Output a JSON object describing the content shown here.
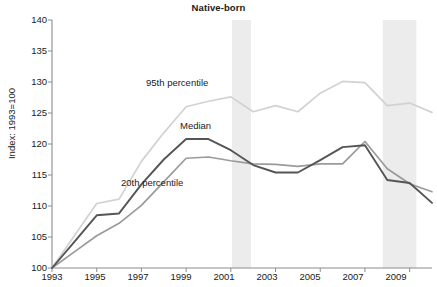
{
  "chart_data": {
    "type": "line",
    "title": "Native-born",
    "xlabel": "",
    "ylabel": "Index: 1993=100",
    "xlim": [
      1993,
      2010
    ],
    "ylim": [
      100,
      140
    ],
    "y_ticks": [
      100,
      105,
      110,
      115,
      120,
      125,
      130,
      135,
      140
    ],
    "x_ticks": [
      1993,
      1994,
      1995,
      1996,
      1997,
      1998,
      1999,
      2000,
      2001,
      2002,
      2003,
      2004,
      2005,
      2006,
      2007,
      2008,
      2009,
      2010
    ],
    "x_tick_labels": [
      "1993",
      "",
      "1995",
      "",
      "1997",
      "",
      "1999",
      "",
      "2001",
      "",
      "2003",
      "",
      "2005",
      "",
      "2007",
      "",
      "2009",
      ""
    ],
    "grid": false,
    "legend": "inline-annotations",
    "x": [
      1993,
      1994,
      1995,
      1996,
      1997,
      1998,
      1999,
      2000,
      2001,
      2002,
      2003,
      2004,
      2005,
      2006,
      2007,
      2008,
      2009,
      2010
    ],
    "series": [
      {
        "name": "95th percentile",
        "color": "#d2d2d2",
        "values": [
          100.0,
          105.2,
          110.4,
          111.1,
          117.2,
          121.8,
          126.0,
          126.9,
          127.6,
          125.2,
          126.2,
          125.2,
          128.2,
          130.1,
          129.9,
          126.2,
          126.6,
          125.1
        ]
      },
      {
        "name": "Median",
        "color": "#555555",
        "values": [
          100.0,
          104.2,
          108.5,
          108.8,
          113.5,
          117.5,
          120.8,
          120.8,
          119.0,
          116.6,
          115.4,
          115.4,
          117.4,
          119.5,
          119.8,
          114.2,
          113.7,
          110.5
        ]
      },
      {
        "name": "20th percentile",
        "color": "#9a9a9a",
        "values": [
          100.0,
          102.6,
          105.2,
          107.2,
          110.1,
          113.9,
          117.7,
          117.9,
          117.3,
          116.8,
          116.7,
          116.4,
          116.8,
          116.8,
          120.4,
          116.0,
          113.6,
          112.3
        ]
      }
    ],
    "shaded_bands": [
      {
        "name": "recession-band-2001",
        "start": 2001.05,
        "end": 2001.9,
        "color": "#ececec"
      },
      {
        "name": "recession-band-2008",
        "start": 2007.8,
        "end": 2009.3,
        "color": "#ececec"
      }
    ],
    "annotations": [
      {
        "text": "95th percentile",
        "x_px": 146,
        "y_px": 77
      },
      {
        "text": "Median",
        "x_px": 180,
        "y_px": 120
      },
      {
        "text": "20th percentile",
        "x_px": 121,
        "y_px": 177
      }
    ]
  },
  "axis_colors": {
    "axis_line": "#8c8c8c",
    "text": "#1a1a1a",
    "background": "#ffffff"
  }
}
